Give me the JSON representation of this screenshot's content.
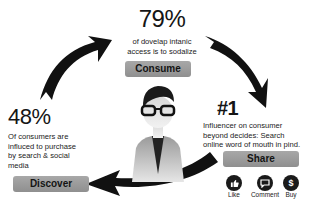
{
  "consume": {
    "stat": "79%",
    "description_line1": "of dovelap intanic",
    "description_line2": "access is to sodalize",
    "label": "Consume"
  },
  "discover": {
    "stat": "48%",
    "description_line1": "Of consumers are",
    "description_line2": "influced to purchase",
    "description_line3": "by search & social",
    "description_line4": "media",
    "label": "Discover"
  },
  "share": {
    "stat": "#1",
    "description_line1": "Influencer on consumer",
    "description_line2": "beyond decides: Search",
    "description_line3": "online word of mouth in pind.",
    "label": "Share",
    "actions": [
      {
        "icon": "thumbs-up-icon",
        "glyph": "👍",
        "label": "Like"
      },
      {
        "icon": "comment-icon",
        "glyph": "▭",
        "label": "Comment"
      },
      {
        "icon": "dollar-icon",
        "glyph": "$",
        "label": "Buy"
      }
    ]
  },
  "colors": {
    "arrow": "#111111",
    "pill": "#999999",
    "background": "#ffffff"
  }
}
